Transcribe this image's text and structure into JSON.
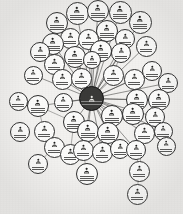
{
  "graph": {
    "type": "node-link-network",
    "title": "Contact Network Graph",
    "layout": "hub-and-spoke radial",
    "node_count": 50,
    "background_color": "#f2f1ef",
    "node_fill_color": "#fbfbfa",
    "node_stroke_color": "#2e2e2e",
    "edge_color": "#3c3c3a",
    "hub_fill_color": "#3a3a38",
    "hub_text_color": "#efefec",
    "label_color": "#1b1b1b",
    "icon_name": "contact-person-icon",
    "legibility_note": "node name labels are sub-pixel in the source scan and not resolvable",
    "hub": {
      "id": "hub",
      "name": "hub-node",
      "label": "",
      "cx": 91.5,
      "cy": 98.5,
      "r": 12.5,
      "icon": "contact-person-icon"
    },
    "nodes": [
      {
        "id": "n01",
        "label": "",
        "cx": 77,
        "cy": 13,
        "r": 11.5
      },
      {
        "id": "n02",
        "label": "",
        "cx": 98,
        "cy": 11,
        "r": 11.0
      },
      {
        "id": "n03",
        "label": "",
        "cx": 120,
        "cy": 12,
        "r": 11.5
      },
      {
        "id": "n04",
        "label": "",
        "cx": 57,
        "cy": 23,
        "r": 11.0
      },
      {
        "id": "n05",
        "label": "",
        "cx": 140,
        "cy": 22,
        "r": 11.5
      },
      {
        "id": "n06",
        "label": "",
        "cx": 107,
        "cy": 31,
        "r": 11.0
      },
      {
        "id": "n07",
        "label": "",
        "cx": 70,
        "cy": 38,
        "r": 10.5
      },
      {
        "id": "n08",
        "label": "",
        "cx": 53,
        "cy": 44,
        "r": 11.0
      },
      {
        "id": "n09",
        "label": "",
        "cx": 88,
        "cy": 39,
        "r": 10.5
      },
      {
        "id": "n10",
        "label": "",
        "cx": 125,
        "cy": 39,
        "r": 10.0
      },
      {
        "id": "n11",
        "label": "",
        "cx": 40,
        "cy": 52,
        "r": 10.0
      },
      {
        "id": "n12",
        "label": "",
        "cx": 75,
        "cy": 57,
        "r": 11.0
      },
      {
        "id": "n13",
        "label": "",
        "cx": 101,
        "cy": 51,
        "r": 11.0
      },
      {
        "id": "n14",
        "label": "",
        "cx": 121,
        "cy": 53,
        "r": 10.0
      },
      {
        "id": "n15",
        "label": "",
        "cx": 54,
        "cy": 64,
        "r": 10.5
      },
      {
        "id": "n16",
        "label": "",
        "cx": 146,
        "cy": 46,
        "r": 10.5
      },
      {
        "id": "n17",
        "label": "",
        "cx": 62,
        "cy": 79,
        "r": 10.5
      },
      {
        "id": "n18",
        "label": "",
        "cx": 81,
        "cy": 78,
        "r": 10.5
      },
      {
        "id": "n19",
        "label": "",
        "cx": 113,
        "cy": 75,
        "r": 10.5
      },
      {
        "id": "n20",
        "label": "",
        "cx": 134,
        "cy": 79,
        "r": 10.5
      },
      {
        "id": "n21",
        "label": "",
        "cx": 152,
        "cy": 71,
        "r": 10.0
      },
      {
        "id": "n22",
        "label": "",
        "cx": 168,
        "cy": 83,
        "r": 10.0
      },
      {
        "id": "n23",
        "label": "",
        "cx": 18,
        "cy": 101,
        "r": 9.5
      },
      {
        "id": "n24",
        "label": "",
        "cx": 38,
        "cy": 106,
        "r": 11.0
      },
      {
        "id": "n25",
        "label": "",
        "cx": 137,
        "cy": 100,
        "r": 11.0
      },
      {
        "id": "n26",
        "label": "",
        "cx": 159,
        "cy": 100,
        "r": 11.0
      },
      {
        "id": "n27",
        "label": "",
        "cx": 74,
        "cy": 122,
        "r": 11.0
      },
      {
        "id": "n28",
        "label": "",
        "cx": 112,
        "cy": 116,
        "r": 11.0
      },
      {
        "id": "n29",
        "label": "",
        "cx": 133,
        "cy": 114,
        "r": 11.0
      },
      {
        "id": "n30",
        "label": "",
        "cx": 155,
        "cy": 117,
        "r": 10.0
      },
      {
        "id": "n31",
        "label": "",
        "cx": 44,
        "cy": 131,
        "r": 10.5
      },
      {
        "id": "n32",
        "label": "",
        "cx": 20,
        "cy": 132,
        "r": 10.0
      },
      {
        "id": "n33",
        "label": "",
        "cx": 88,
        "cy": 131,
        "r": 11.0
      },
      {
        "id": "n34",
        "label": "",
        "cx": 108,
        "cy": 133,
        "r": 11.0
      },
      {
        "id": "n35",
        "label": "",
        "cx": 144,
        "cy": 133,
        "r": 10.5
      },
      {
        "id": "n36",
        "label": "",
        "cx": 163,
        "cy": 131,
        "r": 9.5
      },
      {
        "id": "n37",
        "label": "",
        "cx": 54,
        "cy": 147,
        "r": 10.5
      },
      {
        "id": "n38",
        "label": "",
        "cx": 70,
        "cy": 154,
        "r": 10.5
      },
      {
        "id": "n39",
        "label": "",
        "cx": 83,
        "cy": 150,
        "r": 10.5
      },
      {
        "id": "n40",
        "label": "",
        "cx": 102,
        "cy": 152,
        "r": 10.5
      },
      {
        "id": "n41",
        "label": "",
        "cx": 120,
        "cy": 149,
        "r": 10.0
      },
      {
        "id": "n42",
        "label": "",
        "cx": 136,
        "cy": 150,
        "r": 10.0
      },
      {
        "id": "n43",
        "label": "",
        "cx": 166,
        "cy": 146,
        "r": 9.5
      },
      {
        "id": "n44",
        "label": "",
        "cx": 38,
        "cy": 164,
        "r": 10.0
      },
      {
        "id": "n45",
        "label": "",
        "cx": 87,
        "cy": 174,
        "r": 11.0
      },
      {
        "id": "n46",
        "label": "",
        "cx": 139,
        "cy": 171,
        "r": 10.5
      },
      {
        "id": "n47",
        "label": "",
        "cx": 137,
        "cy": 194,
        "r": 10.5
      },
      {
        "id": "n48",
        "label": "",
        "cx": 33,
        "cy": 75,
        "r": 9.5
      },
      {
        "id": "n49",
        "label": "",
        "cx": 92,
        "cy": 60,
        "r": 9.0
      },
      {
        "id": "n50",
        "label": "",
        "cx": 63,
        "cy": 102,
        "r": 9.5
      }
    ],
    "edges": [
      {
        "from": "hub",
        "to": "n01"
      },
      {
        "from": "hub",
        "to": "n02"
      },
      {
        "from": "hub",
        "to": "n03"
      },
      {
        "from": "hub",
        "to": "n04"
      },
      {
        "from": "hub",
        "to": "n05"
      },
      {
        "from": "hub",
        "to": "n06"
      },
      {
        "from": "hub",
        "to": "n07"
      },
      {
        "from": "hub",
        "to": "n08"
      },
      {
        "from": "hub",
        "to": "n09"
      },
      {
        "from": "hub",
        "to": "n10"
      },
      {
        "from": "hub",
        "to": "n11"
      },
      {
        "from": "hub",
        "to": "n12"
      },
      {
        "from": "hub",
        "to": "n13"
      },
      {
        "from": "hub",
        "to": "n14"
      },
      {
        "from": "hub",
        "to": "n15"
      },
      {
        "from": "hub",
        "to": "n16"
      },
      {
        "from": "hub",
        "to": "n17"
      },
      {
        "from": "hub",
        "to": "n18"
      },
      {
        "from": "hub",
        "to": "n19"
      },
      {
        "from": "hub",
        "to": "n20"
      },
      {
        "from": "hub",
        "to": "n21"
      },
      {
        "from": "hub",
        "to": "n22"
      },
      {
        "from": "hub",
        "to": "n24"
      },
      {
        "from": "hub",
        "to": "n25"
      },
      {
        "from": "hub",
        "to": "n26"
      },
      {
        "from": "hub",
        "to": "n27"
      },
      {
        "from": "hub",
        "to": "n28"
      },
      {
        "from": "hub",
        "to": "n29"
      },
      {
        "from": "hub",
        "to": "n30"
      },
      {
        "from": "hub",
        "to": "n33"
      },
      {
        "from": "hub",
        "to": "n34"
      },
      {
        "from": "hub",
        "to": "n35"
      },
      {
        "from": "hub",
        "to": "n36"
      },
      {
        "from": "hub",
        "to": "n39"
      },
      {
        "from": "hub",
        "to": "n40"
      },
      {
        "from": "hub",
        "to": "n41"
      },
      {
        "from": "hub",
        "to": "n42"
      },
      {
        "from": "hub",
        "to": "n48"
      },
      {
        "from": "hub",
        "to": "n49"
      },
      {
        "from": "hub",
        "to": "n50"
      },
      {
        "from": "n24",
        "to": "n23"
      },
      {
        "from": "n24",
        "to": "n31"
      },
      {
        "from": "n24",
        "to": "n27"
      },
      {
        "from": "n31",
        "to": "n37"
      },
      {
        "from": "n37",
        "to": "n44"
      },
      {
        "from": "n27",
        "to": "n38"
      },
      {
        "from": "n39",
        "to": "n45"
      },
      {
        "from": "n35",
        "to": "n46"
      },
      {
        "from": "n46",
        "to": "n47"
      },
      {
        "from": "n42",
        "to": "n46"
      },
      {
        "from": "n34",
        "to": "n41"
      },
      {
        "from": "n29",
        "to": "n35"
      },
      {
        "from": "n19",
        "to": "n14"
      },
      {
        "from": "n13",
        "to": "n06"
      }
    ]
  }
}
